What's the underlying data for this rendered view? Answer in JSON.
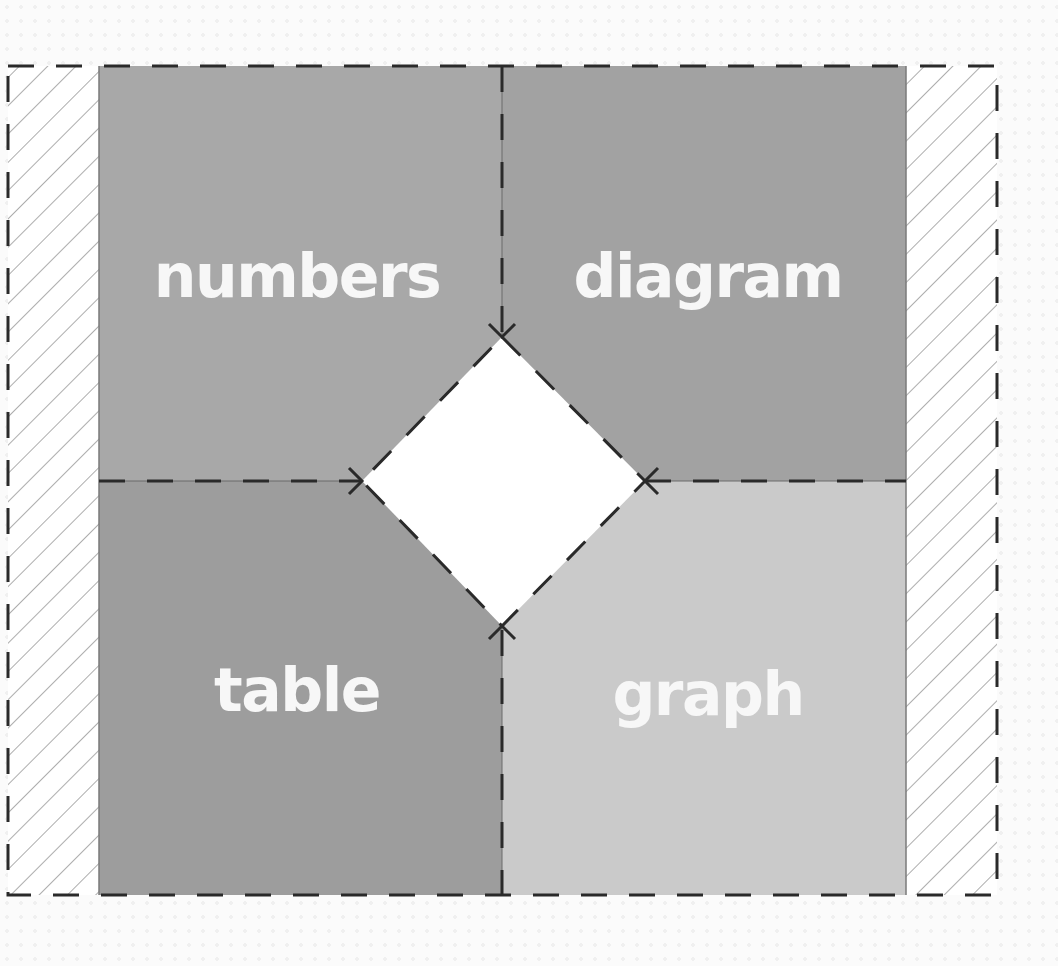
{
  "diagram": {
    "quadrants": [
      {
        "id": "numbers",
        "label": "numbers",
        "color": "#a8a8a8",
        "position": "top-left"
      },
      {
        "id": "diagram",
        "label": "diagram",
        "color": "#a2a2a2",
        "position": "top-right"
      },
      {
        "id": "table",
        "label": "table",
        "color": "#9d9d9d",
        "position": "bottom-left"
      },
      {
        "id": "graph",
        "label": "graph",
        "color": "#cacaca",
        "position": "bottom-right"
      }
    ],
    "center_shape": {
      "type": "diamond",
      "color": "#ffffff"
    },
    "side_strips": {
      "pattern": "diagonal-hatch",
      "sides": [
        "left",
        "right"
      ]
    },
    "border_style": "dashed",
    "line_color": "#2a2a2a"
  }
}
